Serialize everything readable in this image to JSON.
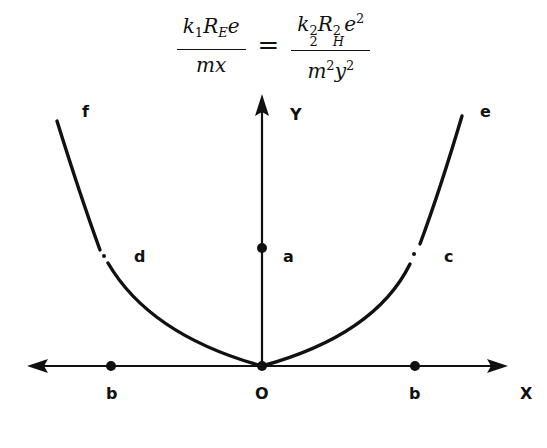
{
  "equation": {
    "lhs_numerator": {
      "k": "k",
      "k_sub": "1",
      "R": "R",
      "R_sub": "E",
      "e": "e"
    },
    "lhs_denominator": {
      "m": "m",
      "x": "x"
    },
    "equals": "=",
    "rhs_numerator": {
      "k": "k",
      "k_sup": "2",
      "k_sub": "2",
      "R": "R",
      "R_sup": "2",
      "R_sub": "H",
      "e": "e",
      "e_sup": "2"
    },
    "rhs_denominator": {
      "m": "m",
      "m_sup": "2",
      "y": "y",
      "y_sup": "2"
    }
  },
  "diagram": {
    "axis_labels": {
      "x": "X",
      "y": "Y",
      "origin": "O"
    },
    "point_labels": {
      "a": "a",
      "b_left": "b",
      "b_right": "b",
      "c": "c",
      "d": "d",
      "e": "e",
      "f": "f"
    },
    "colors": {
      "ink": "#111111",
      "background": "#ffffff"
    }
  }
}
